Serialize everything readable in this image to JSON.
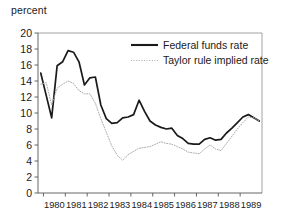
{
  "chart_data": {
    "type": "line",
    "title": "",
    "subtitle": "",
    "xlabel": "",
    "ylabel": "percent",
    "ylim": [
      0,
      20
    ],
    "xlim": [
      1979.75,
      1990.0
    ],
    "ytick_step": 2,
    "yticks": [
      "0",
      "2",
      "4",
      "6",
      "8",
      "10",
      "12",
      "14",
      "16",
      "18",
      "20"
    ],
    "xticks": [
      "1980",
      "1981",
      "1982",
      "1983",
      "1984",
      "1985",
      "1986",
      "1987",
      "1988",
      "1989"
    ],
    "grid": false,
    "legend_position": "top-right",
    "x": [
      1979.875,
      1980.125,
      1980.375,
      1980.625,
      1980.875,
      1981.125,
      1981.375,
      1981.625,
      1981.875,
      1982.125,
      1982.375,
      1982.625,
      1982.875,
      1983.125,
      1983.375,
      1983.625,
      1983.875,
      1984.125,
      1984.375,
      1984.625,
      1984.875,
      1985.125,
      1985.375,
      1985.625,
      1985.875,
      1986.125,
      1986.375,
      1986.625,
      1986.875,
      1987.125,
      1987.375,
      1987.625,
      1987.875,
      1988.125,
      1988.375,
      1988.625,
      1988.875,
      1989.125,
      1989.375,
      1989.625,
      1989.875
    ],
    "series": [
      {
        "name": "Federal funds rate",
        "style": "solid",
        "color": "#1a1a1a",
        "values": [
          15.0,
          12.2,
          9.4,
          15.9,
          16.4,
          17.8,
          17.6,
          16.4,
          13.5,
          14.4,
          14.5,
          11.0,
          9.3,
          8.7,
          8.8,
          9.4,
          9.5,
          9.8,
          11.6,
          10.2,
          9.0,
          8.5,
          8.2,
          8.0,
          8.1,
          7.2,
          6.8,
          6.2,
          6.1,
          6.1,
          6.7,
          6.9,
          6.6,
          6.7,
          7.5,
          8.1,
          8.8,
          9.5,
          9.8,
          9.4,
          9.0
        ]
      },
      {
        "name": "Taylor rule implied rate",
        "style": "dotted",
        "color": "#aaaaaa",
        "values": [
          13.6,
          13.8,
          11.0,
          13.1,
          13.6,
          14.0,
          13.7,
          12.8,
          12.4,
          12.4,
          11.2,
          9.3,
          7.6,
          5.9,
          4.7,
          4.1,
          4.8,
          5.2,
          5.6,
          5.7,
          5.8,
          6.1,
          6.4,
          6.2,
          6.1,
          5.8,
          5.5,
          5.1,
          5.0,
          4.9,
          5.5,
          6.0,
          5.5,
          5.3,
          6.2,
          7.1,
          8.0,
          8.8,
          9.5,
          9.4,
          9.0
        ]
      }
    ]
  }
}
